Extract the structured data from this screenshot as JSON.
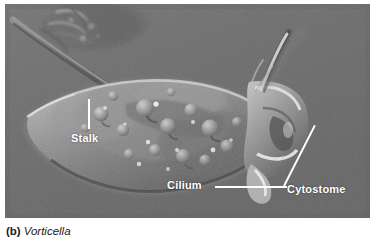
{
  "figure": {
    "caption_letter": "(b)",
    "caption_taxon": "Vorticella",
    "microscopy_badge": "LM",
    "scalebar_text": "25 µm",
    "background_color": "#ffffff",
    "micrograph_background": "#6e6e6e"
  },
  "callouts": [
    {
      "label": "Stalk",
      "leader": "vertical-line"
    },
    {
      "label": "Cilium",
      "leader": "horizontal-line"
    },
    {
      "label": "Cytostome",
      "leader": "diagonal-line"
    }
  ],
  "micrograph": {
    "specimen": "Vorticella",
    "technique": "light microscopy",
    "label_color": "#ffffff"
  }
}
